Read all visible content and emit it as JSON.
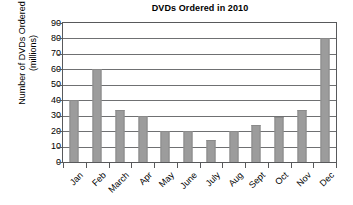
{
  "chart_data": {
    "type": "bar",
    "title": "DVDs Ordered in 2010",
    "xlabel": "",
    "ylabel": "Number of DVDs Ordered (millions)",
    "ylabel_lines": [
      "Number of DVDs Ordered",
      "(millions)"
    ],
    "categories": [
      "Jan",
      "Feb",
      "March",
      "Apr",
      "May",
      "June",
      "July",
      "Aug",
      "Sept",
      "Oct",
      "Nov",
      "Dec"
    ],
    "values": [
      40,
      60,
      34,
      30,
      20,
      20,
      14,
      20,
      24,
      29,
      34,
      80
    ],
    "ylim": [
      0,
      90
    ],
    "ytick_labels": [
      "0",
      "10",
      "20",
      "30",
      "40",
      "50",
      "60",
      "70",
      "80",
      "90"
    ],
    "ytick_values": [
      0,
      10,
      20,
      30,
      40,
      50,
      60,
      70,
      80,
      90
    ],
    "grid": "horizontal",
    "legend": "none",
    "bar_color": "#9c9c9c",
    "axis_color": "#58595b",
    "background_color": "#ffffff"
  }
}
